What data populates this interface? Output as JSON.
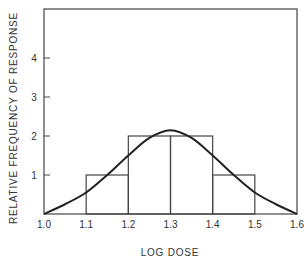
{
  "chart_data": {
    "type": "bar",
    "subtype": "histogram-with-fitted-curve",
    "title": "",
    "xlabel": "LOG DOSE",
    "ylabel": "RELATIVE FREQUENCY OF RESPONSE",
    "xlim": [
      1.0,
      1.6
    ],
    "ylim": [
      0,
      5.0
    ],
    "grid": false,
    "legend": null,
    "x_ticks": [
      "1.0",
      "1.1",
      "1.2",
      "1.3",
      "1.4",
      "1.5",
      "1.6"
    ],
    "y_ticks": [
      "1",
      "2",
      "3",
      "4"
    ],
    "bins": [
      {
        "from": 1.1,
        "to": 1.2,
        "value": 1
      },
      {
        "from": 1.2,
        "to": 1.3,
        "value": 2
      },
      {
        "from": 1.3,
        "to": 1.4,
        "value": 2
      },
      {
        "from": 1.4,
        "to": 1.5,
        "value": 1
      }
    ],
    "curve": {
      "name": "fitted normal curve",
      "x": [
        1.0,
        1.05,
        1.1,
        1.15,
        1.2,
        1.25,
        1.3,
        1.35,
        1.4,
        1.45,
        1.5,
        1.55,
        1.6
      ],
      "y": [
        0.0,
        0.25,
        0.55,
        1.0,
        1.5,
        1.95,
        2.15,
        1.95,
        1.5,
        1.0,
        0.55,
        0.25,
        0.0
      ]
    }
  },
  "axes": {
    "x_title": "LOG DOSE",
    "y_title": "RELATIVE FREQUENCY OF RESPONSE",
    "x_tick_labels": [
      "1.0",
      "1.1",
      "1.2",
      "1.3",
      "1.4",
      "1.5",
      "1.6"
    ],
    "y_tick_labels": [
      "1",
      "2",
      "3",
      "4"
    ]
  }
}
